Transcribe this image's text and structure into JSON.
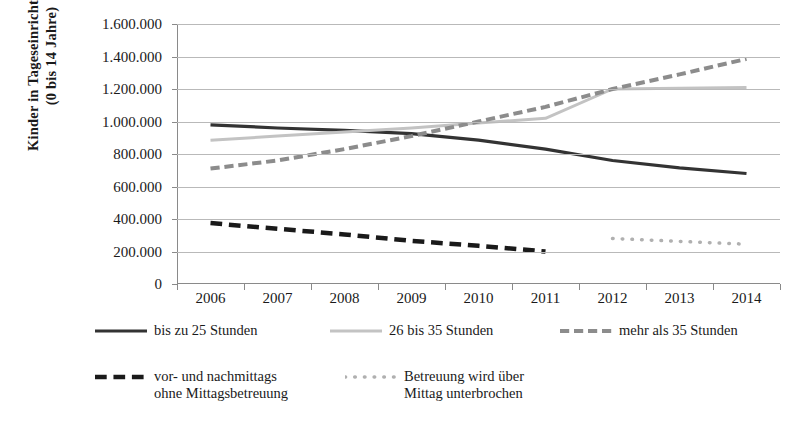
{
  "chart_data": {
    "type": "line",
    "title": "",
    "subtitle": "",
    "xlabel": "",
    "ylabel": "Kinder in Tageseinrichtungen (0 bis 14 Jahre)",
    "ylabel_line1": "Kinder in Tageseinrichtungen",
    "ylabel_line2": "(0 bis 14 Jahre)",
    "categories": [
      "2006",
      "2007",
      "2008",
      "2009",
      "2010",
      "2011",
      "2012",
      "2013",
      "2014"
    ],
    "x": [
      2006,
      2007,
      2008,
      2009,
      2010,
      2011,
      2012,
      2013,
      2014
    ],
    "ylim": [
      0,
      1600000
    ],
    "ytick_values": [
      0,
      200000,
      400000,
      600000,
      800000,
      1000000,
      1200000,
      1400000,
      1600000
    ],
    "ytick_labels": [
      "0",
      "200.000",
      "400.000",
      "600.000",
      "800.000",
      "1.000.000",
      "1.200.000",
      "1.400.000",
      "1.600.000"
    ],
    "grid": true,
    "grid_axis": "y",
    "legend_position": "bottom",
    "series": [
      {
        "name": "bis zu 25 Stunden",
        "style": "solid",
        "color": "#333333",
        "width": 3.2,
        "values": [
          980000,
          960000,
          945000,
          925000,
          885000,
          830000,
          760000,
          715000,
          680000
        ]
      },
      {
        "name": "26 bis 35 Stunden",
        "style": "solid",
        "color": "#c3c3c3",
        "width": 3.0,
        "values": [
          885000,
          910000,
          935000,
          960000,
          990000,
          1020000,
          1200000,
          1205000,
          1210000
        ]
      },
      {
        "name": "mehr als 35 Stunden",
        "style": "dashed",
        "color": "#8c8c8c",
        "width": 4.0,
        "values": [
          710000,
          760000,
          830000,
          910000,
          1000000,
          1090000,
          1200000,
          1290000,
          1385000
        ]
      },
      {
        "name": "vor- und nachmittags ohne Mittagsbetreuung",
        "name_line1": "vor- und nachmittags",
        "name_line2": "ohne Mittagsbetreuung",
        "style": "thick-dashed",
        "color": "#1a1a1a",
        "width": 4.5,
        "values": [
          375000,
          340000,
          305000,
          265000,
          235000,
          200000,
          null,
          null,
          null
        ]
      },
      {
        "name": "Betreuung wird über Mittag unterbrochen",
        "name_line1": "Betreuung wird über",
        "name_line2": "Mittag unterbrochen",
        "style": "dotted",
        "color": "#b0b0b0",
        "width": 3.5,
        "values": [
          null,
          null,
          null,
          null,
          null,
          null,
          280000,
          262000,
          245000
        ]
      }
    ]
  },
  "legend": {
    "row1": [
      {
        "label": "bis zu 25 Stunden",
        "icon": "solid-line-swatch"
      },
      {
        "label": "26 bis 35 Stunden",
        "icon": "solid-line-swatch"
      },
      {
        "label": "mehr als 35 Stunden",
        "icon": "dashed-line-swatch"
      }
    ],
    "row2": [
      {
        "label_line1": "vor- und nachmittags",
        "label_line2": "ohne Mittagsbetreuung",
        "icon": "thick-dashed-line-swatch"
      },
      {
        "label_line1": "Betreuung wird über",
        "label_line2": "Mittag unterbrochen",
        "icon": "dotted-line-swatch"
      }
    ]
  },
  "colors": {
    "series_dark": "#333333",
    "series_light_gray": "#c3c3c3",
    "series_mid_gray": "#8c8c8c",
    "series_black": "#1a1a1a",
    "series_dotted_gray": "#b0b0b0",
    "grid": "#b9b9b9",
    "axis": "#8a8a8a",
    "background": "#ffffff"
  }
}
